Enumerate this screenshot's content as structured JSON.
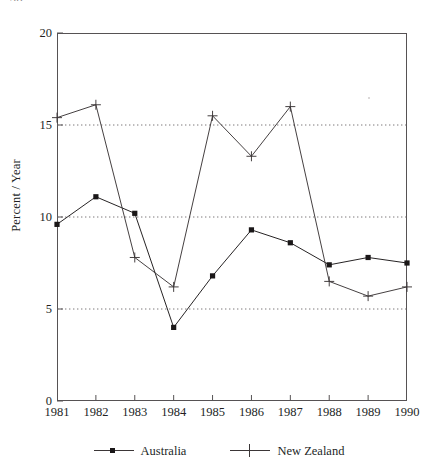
{
  "page": {
    "folio": "38"
  },
  "figure": {
    "yaxis_title": "Percent / Year",
    "y_ticks": [
      "0",
      "5",
      "10",
      "15",
      "20"
    ],
    "x_ticks": [
      "1981",
      "1982",
      "1983",
      "1984",
      "1985",
      "1986",
      "1987",
      "1988",
      "1989",
      "1990"
    ],
    "legend": [
      {
        "label": "Australia",
        "marker": "square-marker"
      },
      {
        "label": "New Zealand",
        "marker": "plus-marker"
      }
    ]
  },
  "chart_data": {
    "type": "line",
    "title": "",
    "subtitle": "",
    "xlabel": "",
    "ylabel": "Percent / Year",
    "x": [
      1981,
      1982,
      1983,
      1984,
      1985,
      1986,
      1987,
      1988,
      1989,
      1990
    ],
    "categories": [
      "1981",
      "1982",
      "1983",
      "1984",
      "1985",
      "1986",
      "1987",
      "1988",
      "1989",
      "1990"
    ],
    "xlim": [
      1981,
      1990
    ],
    "ylim": [
      0,
      20
    ],
    "y_tick_values": [
      0,
      5,
      10,
      15,
      20
    ],
    "x_tick_values": [
      1981,
      1982,
      1983,
      1984,
      1985,
      1986,
      1987,
      1988,
      1989,
      1990
    ],
    "grid": "horizontal-dotted-at-5-10-15",
    "legend_position": "bottom-center",
    "colors": {
      "australia": "#1a1718",
      "new_zealand": "#3b3637",
      "axis": "#565254",
      "gridline": "#6e6a6b"
    },
    "series": [
      {
        "name": "Australia",
        "marker": "square",
        "values": [
          9.6,
          11.1,
          10.2,
          4.0,
          6.8,
          9.3,
          8.6,
          7.4,
          7.8,
          7.5
        ]
      },
      {
        "name": "New Zealand",
        "marker": "plus",
        "values": [
          15.4,
          16.1,
          7.8,
          6.2,
          15.5,
          13.3,
          16.0,
          6.5,
          5.7,
          6.2
        ]
      }
    ],
    "annotations": []
  }
}
